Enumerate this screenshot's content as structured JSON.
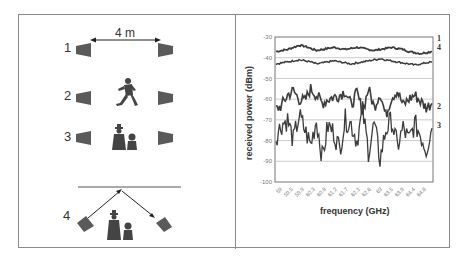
{
  "left_panel": {
    "distance_label": "4 m",
    "scenarios": [
      {
        "id": "1",
        "label": "1",
        "description": "line of sight, no obstruction"
      },
      {
        "id": "2",
        "label": "2",
        "description": "one person walking between antennas"
      },
      {
        "id": "3",
        "label": "3",
        "description": "two people standing between antennas"
      },
      {
        "id": "4",
        "label": "4",
        "description": "reflected path with people blocking direct path"
      }
    ]
  },
  "chart_data": {
    "type": "line",
    "title": "",
    "xlabel": "frequency (GHz)",
    "ylabel": "received power (dBm)",
    "ylim": [
      -100,
      -30
    ],
    "yticks": [
      "-30",
      "-40",
      "-50",
      "-60",
      "-70",
      "-80",
      "-90",
      "-100"
    ],
    "x_tick_labels": [
      "59",
      "59.5",
      "59.9",
      "60.3",
      "60.8",
      "61.2",
      "61.7",
      "62.1",
      "62.6",
      "63",
      "63.5",
      "63.9",
      "64.4",
      "64.8"
    ],
    "xlim": [
      59,
      65
    ],
    "grid": "horizontal",
    "legend": "inline labels at right end",
    "series": [
      {
        "name": "1",
        "approx_mean_dBm": -36,
        "values": [
          -37,
          -36.5,
          -36,
          -35,
          -34,
          -34.5,
          -35.5,
          -36.5,
          -36,
          -35.5,
          -35,
          -35.5,
          -36,
          -35.5,
          -35,
          -35.5,
          -36,
          -36.5,
          -36,
          -35.5,
          -35,
          -35.5,
          -36,
          -37,
          -37.5,
          -38,
          -37.5,
          -37
        ]
      },
      {
        "name": "4",
        "approx_mean_dBm": -42,
        "values": [
          -43,
          -42.5,
          -42,
          -41.5,
          -41,
          -41.5,
          -42,
          -43,
          -42.5,
          -42,
          -41.5,
          -42,
          -42.5,
          -43,
          -42.5,
          -42,
          -41.5,
          -41,
          -40.5,
          -41,
          -41.5,
          -42,
          -42.5,
          -43,
          -43.5,
          -43,
          -42.5,
          -42
        ]
      },
      {
        "name": "2",
        "approx_mean_dBm": -60,
        "values": [
          -65,
          -63,
          -58,
          -56,
          -60,
          -61,
          -55,
          -58,
          -62,
          -60,
          -59,
          -58,
          -56,
          -63,
          -57,
          -66,
          -55,
          -64,
          -57,
          -68,
          -59,
          -56,
          -63,
          -60,
          -58,
          -61,
          -64,
          -62
        ]
      },
      {
        "name": "3",
        "approx_mean_dBm": -75,
        "values": [
          -78,
          -72,
          -70,
          -80,
          -68,
          -75,
          -82,
          -70,
          -88,
          -73,
          -76,
          -84,
          -70,
          -72,
          -80,
          -66,
          -85,
          -72,
          -89,
          -75,
          -70,
          -83,
          -74,
          -80,
          -72,
          -77,
          -84,
          -74
        ]
      }
    ]
  },
  "chart_labels": {
    "series_label_1": "1",
    "series_label_4": "4",
    "series_label_2": "2",
    "series_label_3": "3"
  },
  "colors": {
    "frame": "#8a8a8a",
    "antenna": "#5a5a5a",
    "curve": "#3c3c3c",
    "grid": "#b5b5b5"
  }
}
